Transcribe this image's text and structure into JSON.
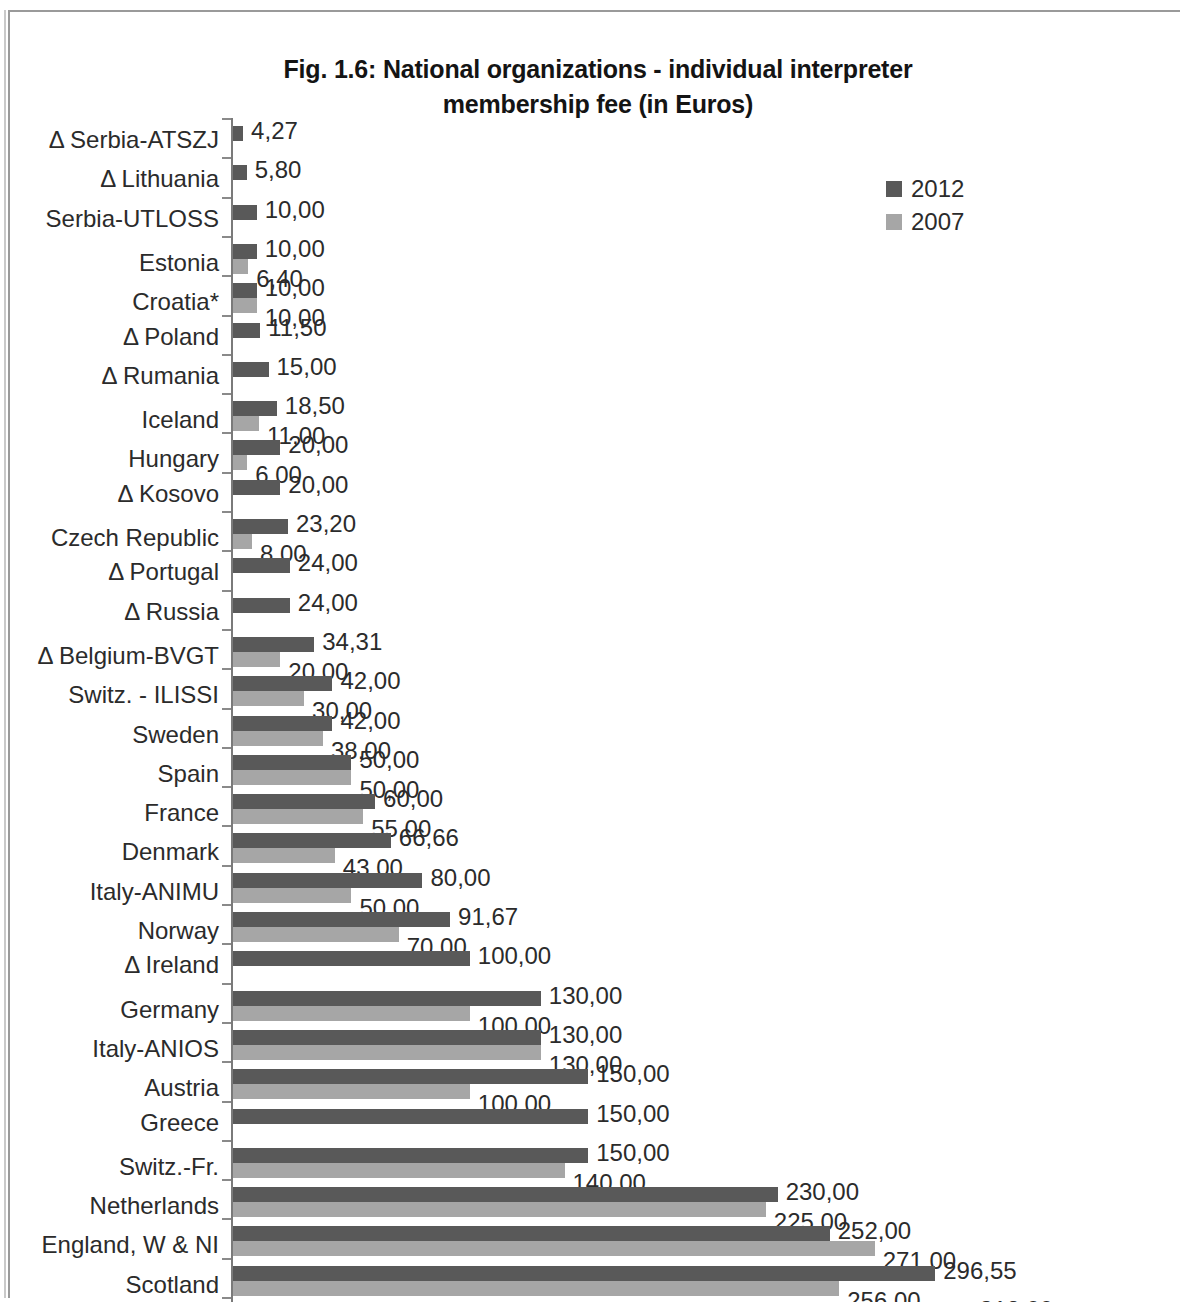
{
  "title": {
    "line1": "Fig. 1.6: National organizations - individual interpreter",
    "line2": "membership fee (in Euros)"
  },
  "legend": {
    "items": [
      {
        "label": "2012",
        "color": "#595959"
      },
      {
        "label": "2007",
        "color": "#a6a6a6"
      }
    ]
  },
  "colors": {
    "series_2012": "#595959",
    "series_2007": "#a6a6a6",
    "axis": "#7a7a7a",
    "text": "#2b2b2b"
  },
  "chart_data": {
    "type": "bar",
    "orientation": "horizontal",
    "title": "Fig. 1.6: National organizations - individual interpreter membership fee (in Euros)",
    "xlabel": "",
    "ylabel": "",
    "unit": "EUR",
    "decimal_separator": ",",
    "grid": false,
    "legend_position": "top-right",
    "xlim": [
      0,
      312
    ],
    "categories": [
      "Δ Serbia-ATSZJ",
      "Δ Lithuania",
      "Serbia-UTLOSS",
      "Estonia",
      "Croatia*",
      "Δ Poland",
      "Δ Rumania",
      "Iceland",
      "Hungary",
      "Δ Kosovo",
      "Czech Republic",
      "Δ Portugal",
      "Δ Russia",
      "Δ Belgium-BVGT",
      "Switz. - ILISSI",
      "Sweden",
      "Spain",
      "France",
      "Denmark",
      "Italy-ANIMU",
      "Norway",
      "Δ Ireland",
      "Germany",
      "Italy-ANIOS",
      "Austria",
      "Greece",
      "Switz.-Fr.",
      "Netherlands",
      "England, W & NI",
      "Scotland",
      "Switz.-Ger."
    ],
    "series": [
      {
        "name": "2012",
        "color": "#595959",
        "values": [
          4.27,
          5.8,
          10.0,
          10.0,
          10.0,
          11.5,
          15.0,
          18.5,
          20.0,
          20.0,
          23.2,
          24.0,
          24.0,
          34.31,
          42.0,
          42.0,
          50.0,
          60.0,
          66.66,
          80.0,
          91.67,
          100.0,
          130.0,
          130.0,
          150.0,
          150.0,
          150.0,
          230.0,
          252.0,
          296.55,
          312.0
        ],
        "labels": [
          "4,27",
          "5,80",
          "10,00",
          "10,00",
          "10,00",
          "11,50",
          "15,00",
          "18,50",
          "20,00",
          "20,00",
          "23,20",
          "24,00",
          "24,00",
          "34,31",
          "42,00",
          "42,00",
          "50,00",
          "60,00",
          "66,66",
          "80,00",
          "91,67",
          "100,00",
          "130,00",
          "130,00",
          "150,00",
          "150,00",
          "150,00",
          "230,00",
          "252,00",
          "296,55",
          "312,00"
        ]
      },
      {
        "name": "2007",
        "color": "#a6a6a6",
        "values": [
          null,
          null,
          null,
          6.4,
          10.0,
          null,
          null,
          11.0,
          6.0,
          null,
          8.0,
          null,
          null,
          20.0,
          30.0,
          38.0,
          50.0,
          55.0,
          43.0,
          50.0,
          70.0,
          null,
          100.0,
          130.0,
          100.0,
          null,
          140.0,
          225.0,
          271.0,
          256.0,
          225.0
        ],
        "labels": [
          null,
          null,
          null,
          "6,40",
          "10,00",
          null,
          null,
          "11,00",
          "6,00",
          null,
          "8,00",
          null,
          null,
          "20,00",
          "30,00",
          "38,00",
          "50,00",
          "55,00",
          "43,00",
          "50,00",
          "70,00",
          null,
          "100,00",
          "130,00",
          "100,00",
          null,
          "140,00",
          "225,00",
          "271,00",
          "256,00",
          "225,00"
        ]
      }
    ]
  }
}
